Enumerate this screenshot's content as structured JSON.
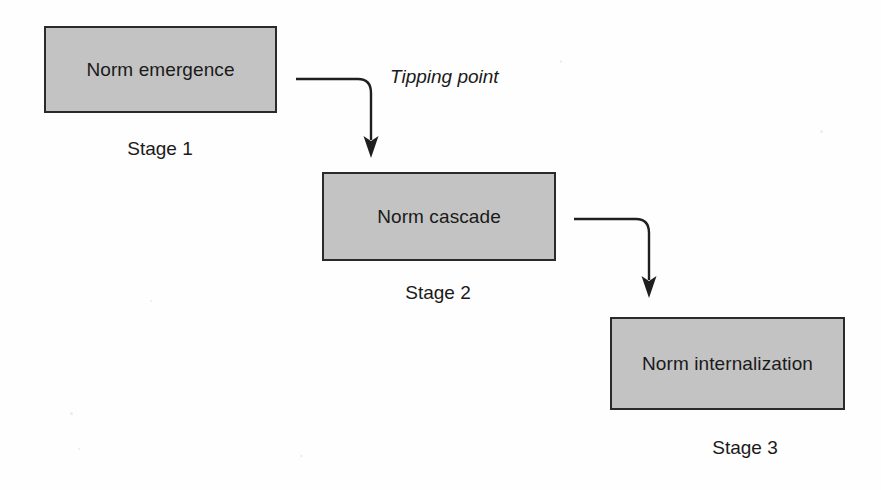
{
  "diagram": {
    "background_color": "#fefefe",
    "node_fill_color": "#c3c3c3",
    "node_border_color": "#2a2a2a",
    "connector_color": "#1f1f1f",
    "text_color": "#1a1a1a",
    "stages": [
      {
        "id": "stage-1",
        "node_label": "Norm emergence",
        "caption": "Stage 1"
      },
      {
        "id": "stage-2",
        "node_label": "Norm cascade",
        "caption": "Stage 2"
      },
      {
        "id": "stage-3",
        "node_label": "Norm internalization",
        "caption": "Stage 3"
      }
    ],
    "connectors": [
      {
        "id": "connector-1",
        "from": "stage-1",
        "to": "stage-2",
        "label": "Tipping point",
        "style": "elbow-curved-arrow"
      },
      {
        "id": "connector-2",
        "from": "stage-2",
        "to": "stage-3",
        "label": "",
        "style": "elbow-curved-arrow"
      }
    ]
  }
}
